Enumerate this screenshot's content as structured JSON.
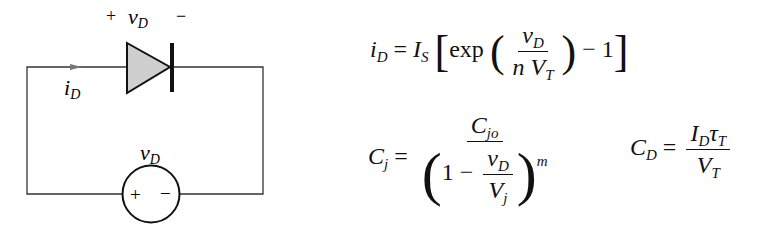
{
  "circuit": {
    "diode_polarity_plus": "+",
    "diode_voltage_label": "v",
    "diode_voltage_sub": "D",
    "diode_polarity_minus": "−",
    "current_label": "i",
    "current_sub": "D",
    "source_label": "v",
    "source_sub": "D",
    "source_plus": "+",
    "source_minus": "−",
    "colors": {
      "wire": "#333333",
      "diode_fill": "#cfcfcf",
      "arrow": "#777777"
    }
  },
  "equations": {
    "diode_current": {
      "lhs": "i",
      "lhs_sub": "D",
      "eq": "=",
      "Is": "I",
      "Is_sub": "S",
      "exp": "exp",
      "num": "v",
      "num_sub": "D",
      "den_n": "n",
      "den_V": "V",
      "den_sub": "T",
      "minus_one": "− 1"
    },
    "junction_capacitance": {
      "lhs": "C",
      "lhs_sub": "j",
      "eq": "=",
      "num": "C",
      "num_sub": "jo",
      "one_minus": "1 −",
      "inner_num": "v",
      "inner_num_sub": "D",
      "inner_den": "V",
      "inner_den_sub": "j",
      "exponent": "m"
    },
    "diffusion_capacitance": {
      "lhs": "C",
      "lhs_sub": "D",
      "eq": "=",
      "num_I": "I",
      "num_I_sub": "D",
      "num_tau": "τ",
      "num_tau_sub": "T",
      "den": "V",
      "den_sub": "T"
    }
  }
}
